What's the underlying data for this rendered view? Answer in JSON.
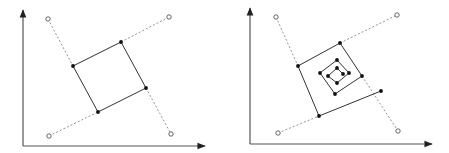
{
  "colors": {
    "axis": "#555555",
    "line": "#333333",
    "dashed": "#777777",
    "point": "#111111",
    "open_point_stroke": "#555555",
    "background": "#ffffff"
  },
  "diagrams": [
    {
      "name": "left-panel",
      "axes": {
        "origin": [
          23,
          146
        ],
        "y_end": [
          23,
          10
        ],
        "x_end": [
          205,
          146
        ]
      },
      "open_points": [
        [
          48,
          19
        ],
        [
          169,
          17
        ],
        [
          49,
          136
        ],
        [
          171,
          134
        ]
      ],
      "dashed_lines": [
        [
          [
            48,
            19
          ],
          [
            73,
            66
          ]
        ],
        [
          [
            146,
            88
          ],
          [
            171,
            134
          ]
        ],
        [
          [
            49,
            136
          ],
          [
            98,
            112
          ]
        ],
        [
          [
            121,
            42
          ],
          [
            169,
            17
          ]
        ]
      ],
      "polyline": [
        [
          73,
          66
        ],
        [
          121,
          42
        ],
        [
          146,
          88
        ],
        [
          98,
          112
        ],
        [
          73,
          66
        ]
      ],
      "filled_points": [
        [
          73,
          66
        ],
        [
          121,
          42
        ],
        [
          146,
          88
        ],
        [
          98,
          112
        ]
      ]
    },
    {
      "name": "right-panel",
      "axes": {
        "origin": [
          250,
          144
        ],
        "y_end": [
          250,
          8
        ],
        "x_end": [
          432,
          144
        ]
      },
      "open_points": [
        [
          276,
          17
        ],
        [
          397,
          15
        ],
        [
          278,
          133
        ],
        [
          398,
          131
        ]
      ],
      "dashed_lines": [
        [
          [
            276,
            17
          ],
          [
            298,
            66
          ]
        ],
        [
          [
            362,
            76
          ],
          [
            398,
            131
          ]
        ],
        [
          [
            278,
            133
          ],
          [
            319,
            116
          ]
        ],
        [
          [
            340,
            43
          ],
          [
            397,
            15
          ]
        ]
      ],
      "polyline": [
        [
          381,
          91
        ],
        [
          319,
          116
        ],
        [
          298,
          66
        ],
        [
          340,
          43
        ],
        [
          362,
          76
        ],
        [
          335,
          94
        ],
        [
          320,
          73
        ],
        [
          337,
          60
        ],
        [
          349,
          73
        ],
        [
          337,
          83
        ],
        [
          328,
          76
        ],
        [
          337,
          68
        ],
        [
          343,
          74
        ]
      ],
      "filled_points": [
        [
          381,
          91
        ],
        [
          319,
          116
        ],
        [
          298,
          66
        ],
        [
          340,
          43
        ],
        [
          362,
          76
        ],
        [
          335,
          94
        ],
        [
          320,
          73
        ],
        [
          337,
          60
        ],
        [
          349,
          73
        ],
        [
          337,
          83
        ],
        [
          328,
          76
        ],
        [
          337,
          68
        ],
        [
          343,
          74
        ]
      ]
    }
  ]
}
